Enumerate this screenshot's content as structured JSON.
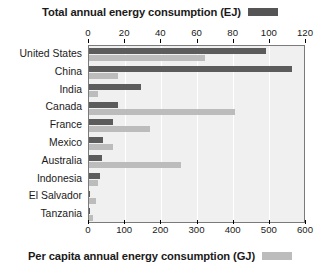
{
  "legend_top": {
    "label": "Total annual energy consumption (EJ)",
    "swatch_name": "total-legend-swatch",
    "color": "#555555"
  },
  "legend_bottom": {
    "label": "Per capita annual energy consumption (GJ)",
    "swatch_name": "percapita-legend-swatch",
    "color": "#bcbcbc"
  },
  "chart_data": {
    "type": "bar",
    "orientation": "horizontal",
    "title": "",
    "grid": true,
    "legend_position": "top-and-bottom",
    "categories": [
      "United States",
      "China",
      "India",
      "Canada",
      "France",
      "Mexico",
      "Australia",
      "Indonesia",
      "El Salvador",
      "Tanzania"
    ],
    "series": [
      {
        "name": "Total annual energy consumption (EJ)",
        "axis": "top",
        "unit": "EJ",
        "color": "#5c5c5c",
        "values": [
          98,
          112,
          29,
          16,
          13,
          8,
          7,
          6,
          0.5,
          0.4
        ]
      },
      {
        "name": "Per capita annual energy consumption (GJ)",
        "axis": "bottom",
        "unit": "GJ",
        "color": "#bcbcbc",
        "values": [
          320,
          80,
          25,
          405,
          170,
          65,
          255,
          25,
          20,
          10
        ]
      }
    ],
    "axes": {
      "top": {
        "label": "Total annual energy consumption (EJ)",
        "min": 0,
        "max": 120,
        "step": 20,
        "ticks": [
          0,
          20,
          40,
          60,
          80,
          100,
          120
        ]
      },
      "bottom": {
        "label": "Per capita annual energy consumption (GJ)",
        "min": 0,
        "max": 600,
        "step": 100,
        "ticks": [
          0,
          100,
          200,
          300,
          400,
          500,
          600
        ]
      }
    }
  }
}
